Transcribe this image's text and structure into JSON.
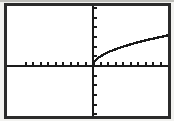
{
  "viewport": {
    "frame_color": "#2b2b2b",
    "background_color": "#ffffff",
    "bezel_color": "#f2f2f0",
    "axis_color": "#1a1a1a",
    "curve_color": "#1a1a1a",
    "label": "graphing-calculator-screen"
  },
  "chart_data": {
    "type": "line",
    "title": "",
    "subtitle": "",
    "xlabel": "",
    "ylabel": "",
    "grid": false,
    "legend": null,
    "legend_position": "none",
    "annotations": [],
    "axes": {
      "x_axis_visible": true,
      "y_axis_visible": true,
      "x_zero_pixel_fraction": 0.535,
      "y_zero_pixel_fraction": 0.545,
      "xlim": [
        -10,
        10
      ],
      "ylim": [
        -6.2,
        6.2
      ],
      "xtick_step": 1,
      "ytick_step": 1,
      "xticks": [
        -9,
        -8,
        -7,
        -6,
        -5,
        -4,
        -3,
        -2,
        -1,
        1,
        2,
        3,
        4,
        5,
        6,
        7,
        8,
        9
      ],
      "yticks": [
        -6,
        -5,
        -4,
        -3,
        -2,
        -1,
        1,
        2,
        3,
        4,
        5,
        6
      ],
      "tick_labels_shown": false,
      "tick_length": 4
    },
    "series": [
      {
        "name": "y = sqrt(x)",
        "expression": "y=√x",
        "domain": [
          0,
          10
        ],
        "x": [
          0,
          0.15,
          0.35,
          0.6,
          0.9,
          1.3,
          1.8,
          2.3,
          2.9,
          3.6,
          4.3,
          5.1,
          6.0,
          6.9,
          7.9,
          9.0,
          10.0
        ],
        "y": [
          0,
          0.39,
          0.59,
          0.77,
          0.95,
          1.14,
          1.34,
          1.52,
          1.7,
          1.9,
          2.07,
          2.26,
          2.45,
          2.63,
          2.81,
          3.0,
          3.16
        ]
      }
    ]
  }
}
